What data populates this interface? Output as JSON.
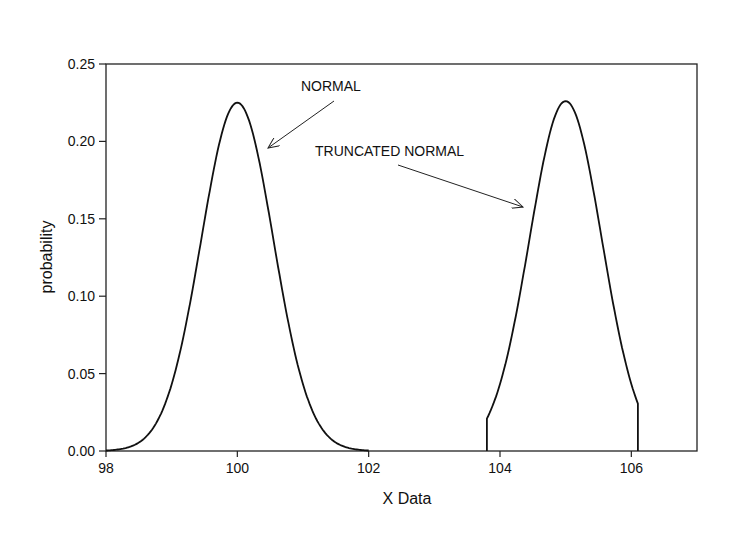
{
  "chart_data": {
    "type": "line",
    "title": "",
    "xlabel": "X Data",
    "ylabel": "probability",
    "xlim": [
      98,
      107
    ],
    "ylim": [
      0,
      0.25
    ],
    "xticks": [
      98,
      100,
      102,
      104,
      106
    ],
    "xtick_labels": [
      "98",
      "100",
      "102",
      "104",
      "106"
    ],
    "yticks": [
      0.0,
      0.05,
      0.1,
      0.15,
      0.2,
      0.25
    ],
    "ytick_labels": [
      "0.00",
      "0.05",
      "0.10",
      "0.15",
      "0.20",
      "0.25"
    ],
    "grid": false,
    "legend": null,
    "series": [
      {
        "name": "NORMAL",
        "mean": 100,
        "sd": 0.5,
        "peak": 0.225,
        "x": [
          98.0,
          98.5,
          99.0,
          99.25,
          99.5,
          99.75,
          100.0,
          100.25,
          100.5,
          100.75,
          101.0,
          101.5,
          102.0
        ],
        "y": [
          0.0,
          0.009,
          0.03,
          0.07,
          0.137,
          0.199,
          0.225,
          0.199,
          0.137,
          0.07,
          0.03,
          0.009,
          0.0
        ]
      },
      {
        "name": "TRUNCATED NORMAL",
        "mean": 105,
        "sd": 0.5,
        "peak": 0.226,
        "truncation": [
          103.8,
          106.1
        ],
        "x": [
          103.8,
          103.8,
          104.0,
          104.25,
          104.5,
          104.75,
          105.0,
          105.25,
          105.5,
          105.75,
          106.0,
          106.1,
          106.1
        ],
        "y": [
          0.0,
          0.025,
          0.045,
          0.08,
          0.145,
          0.205,
          0.226,
          0.205,
          0.145,
          0.08,
          0.045,
          0.036,
          0.0
        ]
      }
    ],
    "annotations": [
      {
        "text": "NORMAL",
        "text_pos": [
          101.2,
          0.225
        ],
        "arrow_to": [
          100.35,
          0.18
        ]
      },
      {
        "text": "TRUNCATED NORMAL",
        "text_pos": [
          101.35,
          0.183
        ],
        "arrow_to": [
          104.48,
          0.148
        ]
      }
    ]
  }
}
